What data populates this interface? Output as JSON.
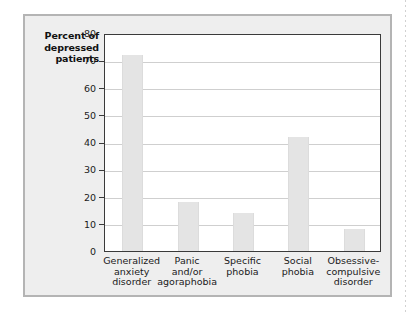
{
  "chart_data": {
    "type": "bar",
    "title": "",
    "xlabel": "",
    "ylabel": "Percent of depressed patients",
    "ylabel_lines": [
      "Percent of",
      "depressed",
      "patients"
    ],
    "categories": [
      "Generalized anxiety disorder",
      "Panic and/or agoraphobia",
      "Specific phobia",
      "Social phobia",
      "Obsessive-compulsive disorder"
    ],
    "category_lines": [
      [
        "Generalized",
        "anxiety",
        "disorder"
      ],
      [
        "Panic",
        "and/or",
        "agoraphobia"
      ],
      [
        "Specific",
        "phobia"
      ],
      [
        "Social",
        "phobia"
      ],
      [
        "Obsessive-",
        "compulsive",
        "disorder"
      ]
    ],
    "values": [
      72,
      18,
      14,
      42,
      8
    ],
    "ylim": [
      0,
      80
    ],
    "yticks": [
      0,
      10,
      20,
      30,
      40,
      50,
      60,
      70,
      80
    ],
    "ytick_labels": [
      "0",
      "10",
      "20",
      "30",
      "40",
      "50",
      "60",
      "70",
      "80"
    ],
    "grid": true,
    "legend": null,
    "legend_position": "none",
    "colors": {
      "bar_fill": "#e4e4e4",
      "panel_background": "#eeeeee",
      "panel_border": "#b4b4b4",
      "plot_background": "#ffffff",
      "plot_border": "#3a3a3a",
      "gridline": "#cfcfcf",
      "text": "#1a1a1a"
    }
  }
}
